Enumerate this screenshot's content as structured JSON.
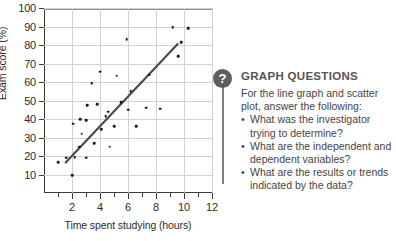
{
  "chart_data": {
    "type": "scatter",
    "title": "",
    "xlabel": "Time spent studying (hours)",
    "ylabel": "Exam score (%)",
    "xlim": [
      0,
      12
    ],
    "ylim": [
      0,
      100
    ],
    "xticks": [
      2,
      4,
      6,
      8,
      10,
      12
    ],
    "yticks": [
      10,
      20,
      30,
      40,
      50,
      60,
      70,
      80,
      90,
      100
    ],
    "grid": true,
    "legend": "none",
    "series": [
      {
        "name": "Students",
        "type": "scatter",
        "points": [
          [
            1.0,
            16.5
          ],
          [
            1.6,
            19.0
          ],
          [
            2.0,
            9.5
          ],
          [
            2.1,
            37.5
          ],
          [
            2.2,
            19.5
          ],
          [
            2.5,
            25.0
          ],
          [
            2.6,
            40.0
          ],
          [
            2.7,
            32.0
          ],
          [
            3.0,
            19.0
          ],
          [
            3.0,
            39.5
          ],
          [
            3.1,
            47.5
          ],
          [
            3.4,
            59.5
          ],
          [
            3.6,
            27.0
          ],
          [
            3.8,
            48.0
          ],
          [
            4.0,
            65.5
          ],
          [
            4.1,
            34.5
          ],
          [
            4.4,
            41.5
          ],
          [
            4.6,
            44.0
          ],
          [
            4.7,
            25.0
          ],
          [
            5.0,
            36.0
          ],
          [
            5.2,
            63.5
          ],
          [
            5.5,
            49.0
          ],
          [
            5.9,
            83.0
          ],
          [
            6.0,
            45.0
          ],
          [
            6.2,
            55.0
          ],
          [
            6.6,
            36.0
          ],
          [
            7.3,
            46.0
          ],
          [
            7.5,
            64.0
          ],
          [
            8.3,
            45.5
          ],
          [
            9.2,
            89.5
          ],
          [
            9.6,
            74.0
          ],
          [
            9.8,
            81.5
          ],
          [
            10.3,
            89.0
          ]
        ]
      },
      {
        "name": "Trend line",
        "type": "line",
        "points": [
          [
            1.55,
            16.5
          ],
          [
            9.55,
            80.5
          ]
        ]
      }
    ]
  },
  "callout": {
    "icon": "question-mark-icon",
    "title": "GRAPH QUESTIONS",
    "intro": "For the line graph and scatter plot, answer the following:",
    "questions": [
      "What was the investigator trying to determine?",
      "What are the independent and dependent variables?",
      "What are the results or trends indicated by the data?"
    ]
  },
  "colors": {
    "point": "#1a1a1a",
    "trend_line": "#4a4a4a",
    "grid": "#d2d2d2",
    "axis": "#3b3b3b",
    "icon_bg": "#5e5e5e",
    "title_text": "#555555",
    "body_text": "#454545"
  }
}
